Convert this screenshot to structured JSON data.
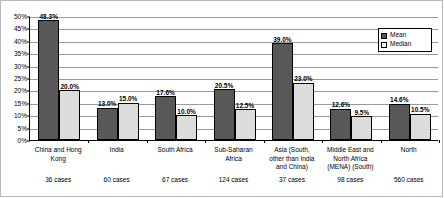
{
  "chart_data": {
    "type": "bar",
    "title": "",
    "xlabel": "",
    "ylabel": "",
    "ylim": [
      0,
      50
    ],
    "ytick_labels": [
      "0%",
      "5%",
      "10%",
      "15%",
      "20%",
      "25%",
      "30%",
      "35%",
      "40%",
      "45%",
      "50%"
    ],
    "ytick_values": [
      0,
      5,
      10,
      15,
      20,
      25,
      30,
      35,
      40,
      45,
      50
    ],
    "grid": true,
    "legend_position": "top-right",
    "categories": [
      "China and Hong\nKong",
      "India",
      "South Africa",
      "Sub-Saharan\nAfrica",
      "Asia (South,\nother than India\nand China)",
      "Middle East and\nNorth Africa\n(MENA) (South)",
      "North"
    ],
    "category_notes": [
      "36 cases",
      "60 cases",
      "67 cases",
      "124 cases",
      "37 cases",
      "98 cases",
      "560 cases"
    ],
    "series": [
      {
        "name": "Mean",
        "color": "#585858",
        "values": [
          48.3,
          13.0,
          17.6,
          20.5,
          39.0,
          12.6,
          14.6
        ],
        "labels": [
          "48.3%",
          "13.0%",
          "17.6%",
          "20.5%",
          "39.0%",
          "12.6%",
          "14.6%"
        ]
      },
      {
        "name": "Median",
        "color": "#dcdcdc",
        "values": [
          20.0,
          15.0,
          10.0,
          12.5,
          23.0,
          9.5,
          10.5
        ],
        "labels": [
          "20.0%",
          "15.0%",
          "10.0%",
          "12.5%",
          "23.0%",
          "9.5%",
          "10.5%"
        ]
      }
    ]
  },
  "legend": {
    "items": [
      {
        "label": "Mean"
      },
      {
        "label": "Median"
      }
    ]
  }
}
